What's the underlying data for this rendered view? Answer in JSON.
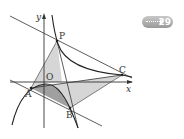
{
  "figure": {
    "axis_labels": {
      "x": "x",
      "y": "y",
      "origin": "O"
    },
    "points": [
      {
        "name": "P",
        "label": "P"
      },
      {
        "name": "A",
        "label": "A"
      },
      {
        "name": "B",
        "label": "B"
      },
      {
        "name": "C",
        "label": "C"
      }
    ],
    "colors": {
      "stroke": "#333333",
      "light_fill": "#d4d4d4",
      "dark_fill": "#9c9c9c"
    }
  },
  "badge": {
    "icon": "dotted-arrow-right-icon",
    "number": "29"
  }
}
